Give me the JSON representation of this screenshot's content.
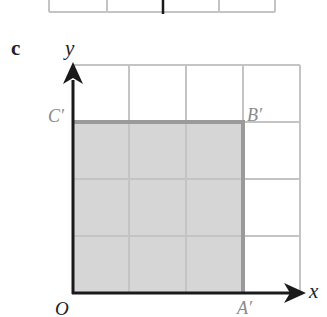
{
  "part_label": "c",
  "axes": {
    "x_label": "x",
    "y_label": "y",
    "origin_label": "O"
  },
  "points": {
    "A_prime": "A′",
    "B_prime": "B′",
    "C_prime": "C′"
  },
  "grid": {
    "columns": 4,
    "rows": 4,
    "cell_px": 57,
    "origin_px": [
      72,
      293
    ]
  },
  "shaded_square": {
    "vertices": {
      "O": [
        0,
        0
      ],
      "A_prime": [
        3,
        0
      ],
      "B_prime": [
        3,
        3
      ],
      "C_prime": [
        0,
        3
      ]
    },
    "fill": "#d6d6d6",
    "edge_color": "#9a9a9a"
  },
  "colors": {
    "grid": "#c4c4c4",
    "axis": "#1a1a1a",
    "label_gray": "#8a8a8a",
    "label_dark": "#222222"
  }
}
